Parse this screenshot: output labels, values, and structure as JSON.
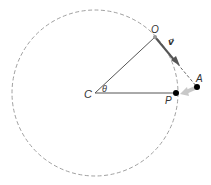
{
  "diagram": {
    "labels": {
      "center": "C",
      "angle": "θ",
      "top_point": "O",
      "velocity": "v⃗",
      "outer_point": "A",
      "circle_point": "P"
    },
    "colors": {
      "circle": "#9a9a9a",
      "lines": "#555555",
      "velocity_arrow": "#555555",
      "force_arrow": "#c8c8c8",
      "points": "#000000"
    }
  }
}
